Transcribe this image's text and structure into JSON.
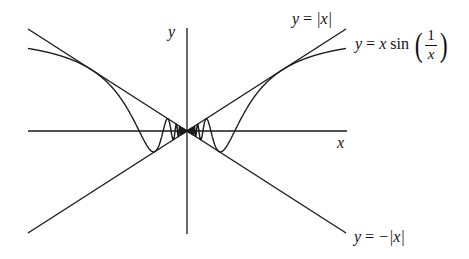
{
  "diagram": {
    "axes": {
      "x_label": "x",
      "y_label": "y"
    },
    "labels": {
      "abs_upper": {
        "lhs": "y",
        "eq": " = ",
        "rhs": "|x|"
      },
      "abs_lower": {
        "lhs": "y",
        "eq": " = ",
        "rhs": "−|x|"
      },
      "curve": {
        "lhs": "y",
        "eq": " = ",
        "x": "x",
        "fn": " sin",
        "num": "1",
        "den": "x",
        "lparen": "(",
        "rparen": ")"
      }
    },
    "colors": {
      "ink": "#1a1a1a",
      "background": "#ffffff"
    }
  },
  "chart_data": {
    "type": "line",
    "title": "",
    "xlabel": "x",
    "ylabel": "y",
    "grid": false,
    "legend": "inline annotations at right ends of curves",
    "xlim": [
      -1.06,
      1.06
    ],
    "ylim": [
      -1.06,
      1.06
    ],
    "series": [
      {
        "name": "y = |x|",
        "function": "abs(x)",
        "domain": [
          -1.06,
          1.06
        ]
      },
      {
        "name": "y = -|x|",
        "function": "-abs(x)",
        "domain": [
          -1.06,
          1.06
        ]
      },
      {
        "name": "y = x sin(1/x)",
        "function": "x*sin(1/x)",
        "domain": [
          -1.06,
          1.06
        ]
      }
    ],
    "key_points": {
      "tangent_to_abs_x": [
        0.6366,
        -0.6366
      ],
      "first_zero_crossings": [
        0.3183,
        -0.3183
      ],
      "tangent_to_neg_abs_x": [
        0.2122,
        -0.2122
      ]
    }
  }
}
